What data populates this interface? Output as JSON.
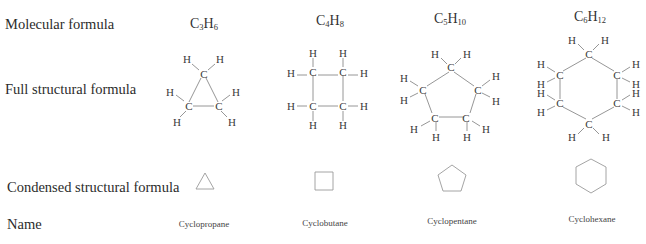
{
  "row_labels": {
    "molecular": "Molecular formula",
    "full": "Full structural formula",
    "condensed": "Condensed structural formula",
    "name": "Name"
  },
  "compounds": [
    {
      "formula_c": "C",
      "c_count": "3",
      "formula_h": "H",
      "h_count": "6",
      "name": "Cyclopropane",
      "ring_size": 3
    },
    {
      "formula_c": "C",
      "c_count": "4",
      "formula_h": "H",
      "h_count": "8",
      "name": "Cyclobutane",
      "ring_size": 4
    },
    {
      "formula_c": "C",
      "c_count": "5",
      "formula_h": "H",
      "h_count": "10",
      "name": "Cyclopentane",
      "ring_size": 5
    },
    {
      "formula_c": "C",
      "c_count": "6",
      "formula_h": "H",
      "h_count": "12",
      "name": "Cyclohexane",
      "ring_size": 6
    }
  ],
  "atoms": {
    "carbon": "C",
    "hydrogen": "H",
    "bond": "—"
  }
}
